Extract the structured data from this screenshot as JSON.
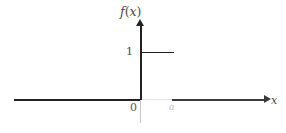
{
  "figure": {
    "type": "step-function-plot",
    "background_color": "#ffffff"
  },
  "labels": {
    "y_axis": "f(x)",
    "y_axis_function_letter": "f",
    "y_axis_open_paren": "(",
    "y_axis_variable": "x",
    "y_axis_close_paren": ")",
    "y_value_one": "1",
    "origin": "0",
    "x_point_a": "a",
    "x_axis": "x"
  },
  "colors": {
    "axis_dark": "#222222",
    "axis_mid": "#3a3a3a",
    "axis_faint": "#e2e2e2",
    "y_axis_below_origin": "#c9c9c9",
    "step_segment": "#1e1e1e",
    "label_text": "#4a4a4a",
    "label_faint": "#b8b8b8"
  },
  "chart_data": {
    "type": "line",
    "title": "",
    "xlabel": "x",
    "ylabel": "f(x)",
    "xlim": [
      -3.8,
      3.9
    ],
    "ylim": [
      -0.7,
      2.3
    ],
    "grid": false,
    "legend": null,
    "series": [
      {
        "name": "f(x)",
        "comment": "constant step of height 1 from x = 0 to x = a",
        "x": [
          0,
          1
        ],
        "values": [
          1,
          1
        ]
      }
    ],
    "annotations": [
      {
        "text": "1",
        "x": 0,
        "y": 1,
        "position": "left-of-axis"
      },
      {
        "text": "0",
        "x": 0,
        "y": 0,
        "position": "below-left-of-origin"
      },
      {
        "text": "a",
        "x": 1,
        "y": 0,
        "position": "below-axis"
      },
      {
        "text": "x",
        "x": 3.9,
        "y": 0,
        "position": "axis-end"
      },
      {
        "text": "f(x)",
        "x": 0,
        "y": 2.3,
        "position": "axis-end"
      }
    ],
    "axis_ticks": {
      "x": [
        "0",
        "a"
      ],
      "y": [
        "1"
      ]
    }
  }
}
